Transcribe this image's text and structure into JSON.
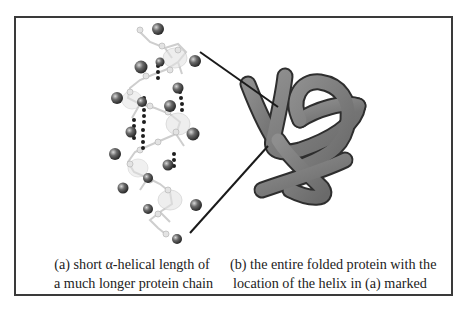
{
  "figure": {
    "panel_a": {
      "label": "(a)",
      "caption_line1": "(a) short α-helical length of",
      "caption_line2": "a much longer protein chain",
      "subject": "alpha-helix ball-and-stick model with hydrogen bonds"
    },
    "panel_b": {
      "label": "(b)",
      "caption_line1": "(b) the entire folded protein with the",
      "caption_line2": "location of the helix in (a) marked",
      "subject": "folded protein tube diagram"
    },
    "colors": {
      "frame": "#3a3a3a",
      "tube_fill": "#7d7d7d",
      "tube_outline": "#2e2e2e",
      "sphere": "#555555",
      "hbond": "#1e1e1e",
      "pointer_line": "#1a1a1a"
    }
  }
}
